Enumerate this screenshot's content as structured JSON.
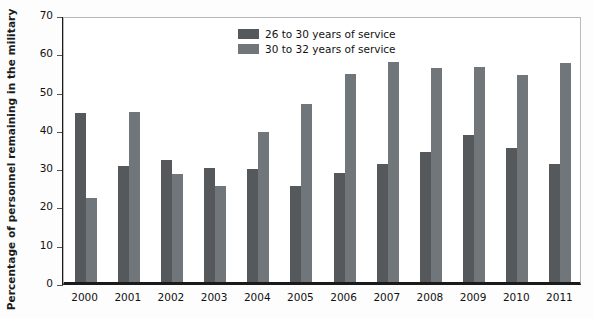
{
  "chart_data": {
    "type": "bar",
    "title": "",
    "xlabel": "",
    "ylabel": "Percentage of personnel remaining in the military",
    "categories": [
      "2000",
      "2001",
      "2002",
      "2003",
      "2004",
      "2005",
      "2006",
      "2007",
      "2008",
      "2009",
      "2010",
      "2011"
    ],
    "series": [
      {
        "name": "26 to 30 years of service",
        "color": "#55595c",
        "values": [
          44.2,
          30.4,
          31.9,
          29.8,
          29.4,
          25.2,
          28.5,
          30.8,
          34.0,
          38.3,
          34.9,
          30.9
        ]
      },
      {
        "name": "30 to 32 years of service",
        "color": "#70767a",
        "values": [
          22.0,
          44.4,
          28.3,
          25.2,
          39.3,
          46.5,
          54.3,
          57.4,
          56.0,
          56.2,
          54.0,
          57.2
        ]
      }
    ],
    "ylim": [
      0,
      70
    ],
    "yticks": [
      0,
      10,
      20,
      30,
      40,
      50,
      60,
      70
    ],
    "ytick_labels": [
      "0",
      "10",
      "20",
      "30",
      "40",
      "50",
      "60",
      "70"
    ],
    "grid": false,
    "legend_position": "top-center"
  }
}
